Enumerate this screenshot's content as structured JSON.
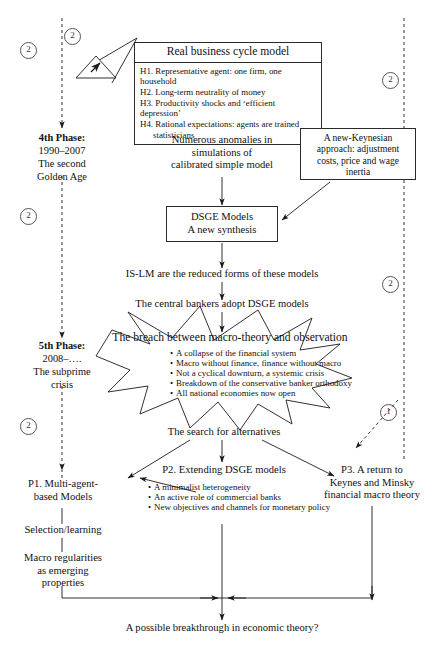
{
  "diagram": {
    "title_note": "Evolution of macroeconomic theory flowchart",
    "rbc_box": {
      "header": "Real business cycle model",
      "hypotheses": [
        "H1. Representative agent: one firm, one household",
        "H2. Long-term neutrality of money",
        "H3. Productivity shocks and ‘efficient depression’",
        "H4. Rational expectations: agents are trained",
        "statisticians"
      ]
    },
    "anomalies": [
      "Numerous anomalies in",
      "simulations of",
      "calibrated simple model"
    ],
    "new_keynesian": [
      "A new-Keynesian",
      "approach: adjustment",
      "costs, price and wage",
      "inertia"
    ],
    "dsge_box": [
      "DSGE Models",
      "A new synthesis"
    ],
    "is_lm": "IS-LM are the reduced forms of these models",
    "central_bankers": "The central bankers adopt DSGE models",
    "starburst": {
      "title": "The breach between macro-theory and observation",
      "bullets": [
        "A collapse of the financial system",
        "Macro without finance, finance without macro",
        "Not a cyclical downturn, a systemic crisis",
        "Breakdown of the conservative banker orthodoxy",
        "All national economies now open"
      ]
    },
    "search": "The search for alternatives",
    "p1": {
      "title": [
        "P1. Multi-agent-",
        "based Models"
      ],
      "step1": "Selection/learning",
      "step2": [
        "Macro regularities",
        "as emerging",
        "properties"
      ]
    },
    "p2": {
      "title": "P2. Extending DSGE models",
      "bullets": [
        "A minimalist heterogeneity",
        "An active role of commercial banks",
        "New objectives and channels for monetary policy"
      ]
    },
    "p3": {
      "title": [
        "P3. A return to",
        "Keynes and Minsky",
        "financial macro theory"
      ]
    },
    "conclusion": "A possible breakthrough in economic theory?",
    "phases": [
      {
        "name": "4th Phase:",
        "lines": [
          "1990–2007",
          "The second",
          "Golden Age"
        ]
      },
      {
        "name": "5th Phase:",
        "lines": [
          "2008–….",
          "The subprime",
          "crisis"
        ]
      }
    ],
    "markers": [
      {
        "label": "2",
        "side": "left-top"
      },
      {
        "label": "2",
        "side": "top-triangle"
      },
      {
        "label": "2",
        "side": "right-top"
      },
      {
        "label": "2",
        "side": "left-mid"
      },
      {
        "label": "2",
        "side": "right-mid"
      },
      {
        "label": "2",
        "side": "left-low"
      },
      {
        "label": "1",
        "side": "right-low"
      }
    ],
    "icons": {
      "warning": "warning-triangle-icon"
    }
  }
}
